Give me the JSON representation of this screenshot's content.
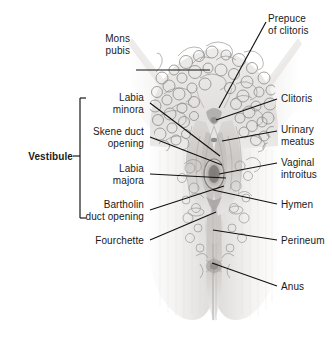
{
  "figure": {
    "kind": "anatomical-illustration",
    "style": "grayscale line drawing with stippled shading",
    "colors": {
      "background": "#ffffff",
      "text": "#1a1a1a",
      "leader_line": "#111111",
      "skin_light": "#f2f1f0",
      "skin_mid": "#e0dedd",
      "skin_shadow": "#bdbab8",
      "hair_line": "#8f8d8c",
      "cleft_dark": "#9a9796"
    }
  },
  "labels": {
    "left": [
      {
        "name": "mons-pubis",
        "lines": [
          "Mons",
          "pubis"
        ],
        "x": 130,
        "y": 33,
        "align": "right",
        "bold": false
      },
      {
        "name": "labia-minora",
        "lines": [
          "Labia",
          "minora"
        ],
        "x": 144,
        "y": 92,
        "align": "right",
        "bold": false
      },
      {
        "name": "skene-duct-opening",
        "lines": [
          "Skene duct",
          "opening"
        ],
        "x": 144,
        "y": 126,
        "align": "right",
        "bold": false
      },
      {
        "name": "labia-majora",
        "lines": [
          "Labia",
          "majora"
        ],
        "x": 144,
        "y": 163,
        "align": "right",
        "bold": false
      },
      {
        "name": "bartholin-duct-opening",
        "lines": [
          "Bartholin",
          "duct opening"
        ],
        "x": 144,
        "y": 199,
        "align": "right",
        "bold": false
      },
      {
        "name": "fourchette",
        "lines": [
          "Fourchette"
        ],
        "x": 144,
        "y": 235,
        "align": "right",
        "bold": false
      }
    ],
    "right": [
      {
        "name": "prepuce-of-clitoris",
        "lines": [
          "Prepuce",
          "of clitoris"
        ],
        "x": 268,
        "y": 13,
        "align": "left",
        "bold": false
      },
      {
        "name": "clitoris",
        "lines": [
          "Clitoris"
        ],
        "x": 281,
        "y": 93,
        "align": "left",
        "bold": false
      },
      {
        "name": "urinary-meatus",
        "lines": [
          "Urinary",
          "meatus"
        ],
        "x": 281,
        "y": 124,
        "align": "left",
        "bold": false
      },
      {
        "name": "vaginal-introitus",
        "lines": [
          "Vaginal",
          "introitus"
        ],
        "x": 281,
        "y": 157,
        "align": "left",
        "bold": false
      },
      {
        "name": "hymen",
        "lines": [
          "Hymen"
        ],
        "x": 281,
        "y": 199,
        "align": "left",
        "bold": false
      },
      {
        "name": "perineum",
        "lines": [
          "Perineum"
        ],
        "x": 281,
        "y": 235,
        "align": "left",
        "bold": false
      },
      {
        "name": "anus",
        "lines": [
          "Anus"
        ],
        "x": 281,
        "y": 281,
        "align": "left",
        "bold": false
      }
    ],
    "bracket": {
      "name": "vestibule",
      "text": "Vestibule",
      "x": 73,
      "y": 151,
      "bold": true,
      "bracket_x": 80,
      "bracket_top": 98,
      "bracket_bottom": 218,
      "tick_len": 6
    }
  },
  "leaders": [
    {
      "name": "leader-mons-pubis",
      "x1": 136,
      "y1": 70,
      "x2": 210,
      "y2": 70
    },
    {
      "name": "leader-labia-minora",
      "x1": 150,
      "y1": 103,
      "x2": 220,
      "y2": 156
    },
    {
      "name": "leader-skene-duct-opening",
      "x1": 150,
      "y1": 137,
      "x2": 222,
      "y2": 165
    },
    {
      "name": "leader-labia-majora",
      "x1": 150,
      "y1": 174,
      "x2": 226,
      "y2": 178
    },
    {
      "name": "leader-bartholin-duct",
      "x1": 150,
      "y1": 210,
      "x2": 224,
      "y2": 186
    },
    {
      "name": "leader-fourchette",
      "x1": 150,
      "y1": 240,
      "x2": 216,
      "y2": 212
    },
    {
      "name": "leader-prepuce-of-clitoris",
      "x1": 266,
      "y1": 22,
      "x2": 219,
      "y2": 108
    },
    {
      "name": "leader-clitoris",
      "x1": 277,
      "y1": 99,
      "x2": 216,
      "y2": 120
    },
    {
      "name": "leader-urinary-meatus",
      "x1": 277,
      "y1": 131,
      "x2": 222,
      "y2": 141
    },
    {
      "name": "leader-vaginal-introitus",
      "x1": 277,
      "y1": 163,
      "x2": 219,
      "y2": 174
    },
    {
      "name": "leader-hymen",
      "x1": 277,
      "y1": 204,
      "x2": 213,
      "y2": 190
    },
    {
      "name": "leader-perineum",
      "x1": 277,
      "y1": 240,
      "x2": 213,
      "y2": 230
    },
    {
      "name": "leader-anus",
      "x1": 277,
      "y1": 286,
      "x2": 212,
      "y2": 263
    }
  ]
}
